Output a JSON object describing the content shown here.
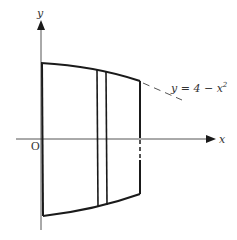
{
  "diagram": {
    "axes": {
      "x_label": "x",
      "y_label": "y",
      "origin_label": "O"
    },
    "curve_label": {
      "prefix": "y = 4 − x",
      "exponent": "2"
    },
    "colors": {
      "axis": "#555555",
      "outline": "#1a1a1a",
      "text": "#333333"
    }
  }
}
